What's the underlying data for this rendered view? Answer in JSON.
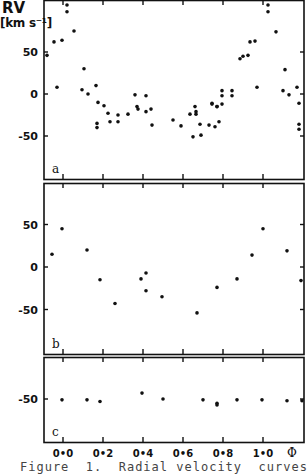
{
  "figure": {
    "ylabel_title": "RV",
    "ylabel_unit": "[km s⁻¹]",
    "caption": "Figure  1.  Radial velocity  curves",
    "x_tick_labels": [
      "0.0",
      "0.2",
      "0.4",
      "0.6",
      "0.8",
      "1.0"
    ],
    "x_axis_symbol": "Φ"
  },
  "chart_data": [
    {
      "type": "scatter",
      "panel_label": "a",
      "title": "",
      "xlabel": "Φ",
      "ylabel": "RV [km s-1]",
      "xlim": [
        -0.08,
        1.21
      ],
      "ylim": [
        -100,
        112
      ],
      "y_ticks": [
        50,
        0,
        -50
      ],
      "x_ticks": [
        0.0,
        0.2,
        0.4,
        0.6,
        0.8,
        1.0
      ],
      "grid": false,
      "points": [
        [
          -0.08,
          46
        ],
        [
          -0.045,
          62
        ],
        [
          -0.03,
          8
        ],
        [
          -0.005,
          64
        ],
        [
          0.02,
          106
        ],
        [
          0.02,
          98
        ],
        [
          0.055,
          75
        ],
        [
          0.105,
          30
        ],
        [
          0.095,
          5
        ],
        [
          0.125,
          0
        ],
        [
          0.165,
          10
        ],
        [
          0.175,
          -10
        ],
        [
          0.205,
          -14
        ],
        [
          0.225,
          -23
        ],
        [
          0.275,
          -25
        ],
        [
          0.325,
          -24
        ],
        [
          0.36,
          -1
        ],
        [
          0.37,
          -15
        ],
        [
          0.375,
          -18
        ],
        [
          0.415,
          -2
        ],
        [
          0.415,
          -21
        ],
        [
          0.44,
          -18
        ],
        [
          0.17,
          -35
        ],
        [
          0.17,
          -40
        ],
        [
          0.235,
          -33
        ],
        [
          0.275,
          -33
        ],
        [
          0.445,
          -37
        ],
        [
          0.55,
          -31
        ],
        [
          0.59,
          -38
        ],
        [
          0.635,
          -24
        ],
        [
          0.66,
          -15
        ],
        [
          0.665,
          -21
        ],
        [
          0.665,
          -24
        ],
        [
          0.685,
          -36
        ],
        [
          0.73,
          -37
        ],
        [
          0.65,
          -51
        ],
        [
          0.69,
          -49
        ],
        [
          0.745,
          -11
        ],
        [
          0.77,
          -15
        ],
        [
          0.795,
          -12
        ],
        [
          0.78,
          -33
        ],
        [
          0.76,
          -39
        ],
        [
          0.795,
          -2
        ],
        [
          0.795,
          4
        ],
        [
          0.745,
          -12
        ],
        [
          0.77,
          -15
        ],
        [
          0.845,
          4
        ],
        [
          0.845,
          -2
        ],
        [
          0.885,
          42
        ],
        [
          0.9,
          45
        ],
        [
          0.925,
          46
        ],
        [
          0.935,
          62
        ],
        [
          0.96,
          63
        ],
        [
          0.97,
          8
        ],
        [
          1.025,
          106
        ],
        [
          1.025,
          98
        ],
        [
          1.065,
          74
        ],
        [
          1.11,
          29
        ],
        [
          1.1,
          4
        ],
        [
          1.13,
          -1
        ],
        [
          1.17,
          8
        ],
        [
          1.18,
          -11
        ],
        [
          1.18,
          -36
        ],
        [
          1.18,
          -42
        ]
      ]
    },
    {
      "type": "scatter",
      "panel_label": "b",
      "title": "",
      "xlabel": "Φ",
      "ylabel": "RV [km s-1]",
      "xlim": [
        -0.08,
        1.21
      ],
      "ylim": [
        -100,
        100
      ],
      "y_ticks": [
        50,
        0,
        -50
      ],
      "x_ticks": [
        0.0,
        0.2,
        0.4,
        0.6,
        0.8,
        1.0
      ],
      "grid": false,
      "points": [
        [
          -0.055,
          15
        ],
        [
          -0.005,
          45
        ],
        [
          0.12,
          20
        ],
        [
          0.185,
          -15
        ],
        [
          0.26,
          -43
        ],
        [
          0.39,
          -14
        ],
        [
          0.415,
          -7
        ],
        [
          0.415,
          -28
        ],
        [
          0.495,
          -35
        ],
        [
          0.67,
          -54
        ],
        [
          0.77,
          -24
        ],
        [
          0.87,
          -14
        ],
        [
          0.945,
          14
        ],
        [
          1.0,
          45
        ],
        [
          1.12,
          19
        ],
        [
          1.19,
          -16
        ]
      ]
    },
    {
      "type": "scatter",
      "panel_label": "c",
      "title": "",
      "xlabel": "Φ",
      "ylabel": "RV [km s-1]",
      "xlim": [
        -0.08,
        1.21
      ],
      "ylim": [
        -100,
        0
      ],
      "y_ticks": [
        -50
      ],
      "x_ticks": [
        0.0,
        0.2,
        0.4,
        0.6,
        0.8,
        1.0
      ],
      "grid": false,
      "points": [
        [
          -0.005,
          -51
        ],
        [
          0.12,
          -51
        ],
        [
          0.185,
          -53
        ],
        [
          0.395,
          -43
        ],
        [
          0.5,
          -50
        ],
        [
          0.7,
          -51
        ],
        [
          0.77,
          -57
        ],
        [
          0.77,
          -55
        ],
        [
          0.87,
          -51
        ],
        [
          0.995,
          -51
        ],
        [
          1.12,
          -52
        ],
        [
          1.195,
          -52
        ]
      ]
    }
  ]
}
